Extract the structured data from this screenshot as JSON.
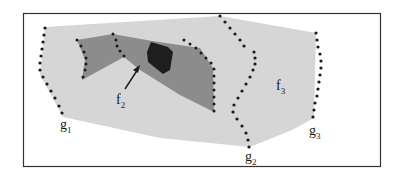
{
  "diagram": {
    "colors": {
      "frame": "#333333",
      "outer_region": "#d6d6d6",
      "inner_region": "#8c8c8c",
      "core_region": "#1e1e1e",
      "dots": "#1a1a1a",
      "background": "#ffffff"
    },
    "labels": {
      "g1": {
        "main": "g",
        "sub": "1"
      },
      "g2": {
        "main": "g",
        "sub": "2"
      },
      "g3": {
        "main": "g",
        "sub": "3"
      },
      "f2": {
        "main": "f",
        "sub": "2"
      },
      "f3": {
        "main": "f",
        "sub": "3"
      }
    }
  }
}
